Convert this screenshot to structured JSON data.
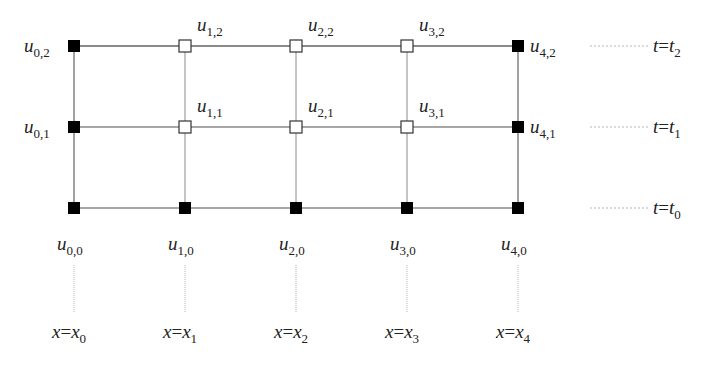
{
  "diagram": {
    "colors": {
      "background": "#ffffff",
      "grid_line": "#8a8a8a",
      "guide_line": "#b5b5b5",
      "known_node_fill": "#000000",
      "unknown_node_fill": "#ffffff",
      "node_stroke": "#333333",
      "text": "#222222"
    },
    "x_positions": [
      74,
      185,
      296,
      407,
      518
    ],
    "y_positions": [
      46,
      127,
      208
    ],
    "node_size": 12,
    "nodes": [
      {
        "i": 0,
        "j": 2,
        "label": "u",
        "sub": "0,2",
        "known": true,
        "label_pos": "left"
      },
      {
        "i": 1,
        "j": 2,
        "label": "u",
        "sub": "1,2",
        "known": false,
        "label_pos": "above-right"
      },
      {
        "i": 2,
        "j": 2,
        "label": "u",
        "sub": "2,2",
        "known": false,
        "label_pos": "above-right"
      },
      {
        "i": 3,
        "j": 2,
        "label": "u",
        "sub": "3,2",
        "known": false,
        "label_pos": "above-right"
      },
      {
        "i": 4,
        "j": 2,
        "label": "u",
        "sub": "4,2",
        "known": true,
        "label_pos": "right"
      },
      {
        "i": 0,
        "j": 1,
        "label": "u",
        "sub": "0,1",
        "known": true,
        "label_pos": "left"
      },
      {
        "i": 1,
        "j": 1,
        "label": "u",
        "sub": "1,1",
        "known": false,
        "label_pos": "above-right"
      },
      {
        "i": 2,
        "j": 1,
        "label": "u",
        "sub": "2,1",
        "known": false,
        "label_pos": "above-right"
      },
      {
        "i": 3,
        "j": 1,
        "label": "u",
        "sub": "3,1",
        "known": false,
        "label_pos": "above-right"
      },
      {
        "i": 4,
        "j": 1,
        "label": "u",
        "sub": "4,1",
        "known": true,
        "label_pos": "right"
      },
      {
        "i": 0,
        "j": 0,
        "label": "u",
        "sub": "0,0",
        "known": true,
        "label_pos": "below"
      },
      {
        "i": 1,
        "j": 0,
        "label": "u",
        "sub": "1,0",
        "known": true,
        "label_pos": "below"
      },
      {
        "i": 2,
        "j": 0,
        "label": "u",
        "sub": "2,0",
        "known": true,
        "label_pos": "below"
      },
      {
        "i": 3,
        "j": 0,
        "label": "u",
        "sub": "3,0",
        "known": true,
        "label_pos": "below"
      },
      {
        "i": 4,
        "j": 0,
        "label": "u",
        "sub": "4,0",
        "known": true,
        "label_pos": "below"
      }
    ],
    "time_labels": [
      {
        "j": 2,
        "var": "t",
        "eq": "=",
        "rhs": "t",
        "sub": "2"
      },
      {
        "j": 1,
        "var": "t",
        "eq": "=",
        "rhs": "t",
        "sub": "1"
      },
      {
        "j": 0,
        "var": "t",
        "eq": "=",
        "rhs": "t",
        "sub": "0"
      }
    ],
    "space_labels": [
      {
        "i": 0,
        "var": "x",
        "eq": "=",
        "rhs": "x",
        "sub": "0"
      },
      {
        "i": 1,
        "var": "x",
        "eq": "=",
        "rhs": "x",
        "sub": "1"
      },
      {
        "i": 2,
        "var": "x",
        "eq": "=",
        "rhs": "x",
        "sub": "2"
      },
      {
        "i": 3,
        "var": "x",
        "eq": "=",
        "rhs": "x",
        "sub": "3"
      },
      {
        "i": 4,
        "var": "x",
        "eq": "=",
        "rhs": "x",
        "sub": "4"
      }
    ],
    "legend": {
      "filled_square": "known value (boundary / initial condition)",
      "open_square": "unknown value"
    }
  }
}
